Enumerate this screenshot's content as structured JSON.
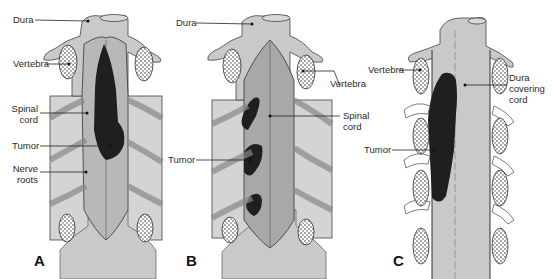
{
  "figure": {
    "type": "anatomical-illustration",
    "colors": {
      "background": "#ffffff",
      "dura": "#c9c9c9",
      "cord": "#b3b3b3",
      "tumor": "#222222",
      "vertebra_fill": "#ffffff",
      "outline": "#333333"
    },
    "panels": [
      {
        "letter": "A",
        "labels": {
          "dura": "Dura",
          "vertebra": "Vertebra",
          "spinal_cord_1": "Spinal",
          "spinal_cord_2": "cord",
          "tumor": "Tumor",
          "nerve_roots_1": "Nerve",
          "nerve_roots_2": "roots"
        }
      },
      {
        "letter": "B",
        "labels": {
          "dura": "Dura",
          "vertebra": "Vertebra",
          "spinal_cord_1": "Spinal",
          "spinal_cord_2": "cord",
          "tumor": "Tumor"
        }
      },
      {
        "letter": "C",
        "labels": {
          "vertebra": "Vertebra",
          "dura_1": "Dura",
          "dura_2": "covering",
          "dura_3": "cord",
          "tumor": "Tumor"
        }
      }
    ]
  }
}
